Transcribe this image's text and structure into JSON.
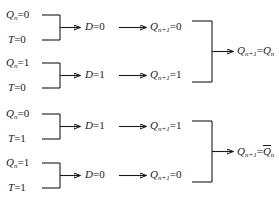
{
  "diagram": {
    "type": "flow-diagram",
    "line_color": "#1a1a1a",
    "background": "#ffffff",
    "cases": [
      {
        "id": "case-1",
        "input_q": {
          "var": "Q",
          "sub": "n",
          "op": "=",
          "value": "0"
        },
        "input_t": {
          "var": "T",
          "sub": "",
          "op": "=",
          "value": "0"
        },
        "d_value": {
          "var": "D",
          "sub": "",
          "op": "=",
          "value": "0"
        },
        "q_next": {
          "var": "Q",
          "sub": "n+1",
          "op": "=",
          "value": "0"
        }
      },
      {
        "id": "case-2",
        "input_q": {
          "var": "Q",
          "sub": "n",
          "op": "=",
          "value": "1"
        },
        "input_t": {
          "var": "T",
          "sub": "",
          "op": "=",
          "value": "0"
        },
        "d_value": {
          "var": "D",
          "sub": "",
          "op": "=",
          "value": "1"
        },
        "q_next": {
          "var": "Q",
          "sub": "n+1",
          "op": "=",
          "value": "1"
        }
      },
      {
        "id": "case-3",
        "input_q": {
          "var": "Q",
          "sub": "n",
          "op": "=",
          "value": "0"
        },
        "input_t": {
          "var": "T",
          "sub": "",
          "op": "=",
          "value": "1"
        },
        "d_value": {
          "var": "D",
          "sub": "",
          "op": "=",
          "value": "1"
        },
        "q_next": {
          "var": "Q",
          "sub": "n+1",
          "op": "=",
          "value": "1"
        }
      },
      {
        "id": "case-4",
        "input_q": {
          "var": "Q",
          "sub": "n",
          "op": "=",
          "value": "1"
        },
        "input_t": {
          "var": "T",
          "sub": "",
          "op": "=",
          "value": "1"
        },
        "d_value": {
          "var": "D",
          "sub": "",
          "op": "=",
          "value": "0"
        },
        "q_next": {
          "var": "Q",
          "sub": "n+1",
          "op": "=",
          "value": "0"
        }
      }
    ],
    "conclusions": [
      {
        "id": "conclusion-top",
        "lhs_var": "Q",
        "lhs_sub": "n+1",
        "op": "=",
        "rhs_var": "Q",
        "rhs_sub": "n",
        "rhs_overbar": false,
        "text": "Q(n+1) = Q(n)"
      },
      {
        "id": "conclusion-bottom",
        "lhs_var": "Q",
        "lhs_sub": "n+1",
        "op": "=",
        "rhs_var": "Q",
        "rhs_sub": "n",
        "rhs_overbar": true,
        "text": "Q(n+1) = NOT Q(n)"
      }
    ]
  }
}
